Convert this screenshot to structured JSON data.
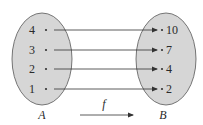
{
  "diagram": {
    "type": "function-mapping",
    "set_a": {
      "label": "A",
      "elements": [
        "4",
        "3",
        "2",
        "1"
      ]
    },
    "set_b": {
      "label": "B",
      "elements": [
        "10",
        "7",
        "4",
        "2"
      ]
    },
    "function_label": "f",
    "mappings": [
      {
        "from": "4",
        "to": "10"
      },
      {
        "from": "3",
        "to": "7"
      },
      {
        "from": "2",
        "to": "4"
      },
      {
        "from": "1",
        "to": "2"
      }
    ],
    "colors": {
      "ellipse_fill": "#d6d6d6",
      "ellipse_stroke": "#555555",
      "arrow": "#333333"
    }
  }
}
